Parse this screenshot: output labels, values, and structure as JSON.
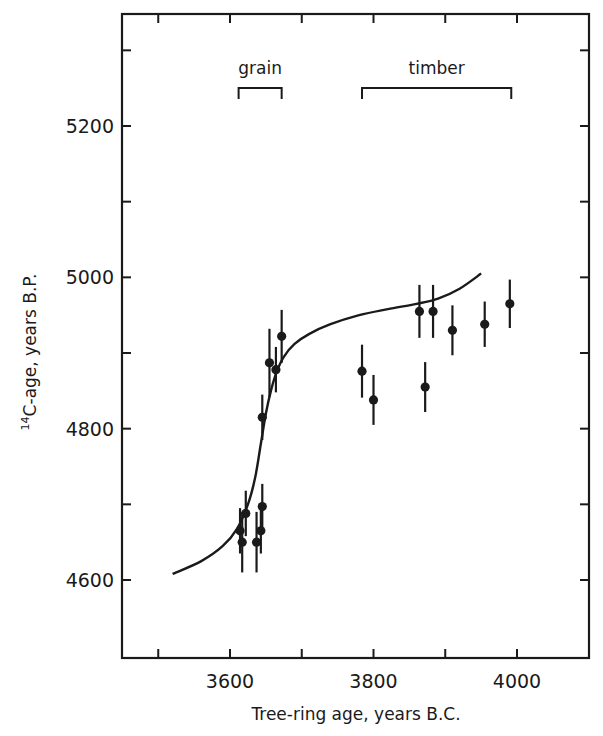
{
  "chart_data": {
    "type": "scatter",
    "title": "",
    "xlabel": "Tree-ring age, years B.C.",
    "ylabel_superscript": "14",
    "ylabel": "C-age, years B.P.",
    "xlim": [
      3450,
      4100
    ],
    "ylim": [
      4500,
      5350
    ],
    "x_ticks": [
      3500,
      3600,
      3700,
      3800,
      3900,
      4000
    ],
    "x_tick_labels": [
      "3600",
      "3800",
      "4000"
    ],
    "x_tick_label_values": [
      3600,
      3800,
      4000
    ],
    "y_ticks": [
      4600,
      4700,
      4800,
      4900,
      5000,
      5100,
      5200,
      5300
    ],
    "y_tick_labels": [
      "4600",
      "4800",
      "5000",
      "5200"
    ],
    "y_tick_label_values": [
      4600,
      4800,
      5000,
      5200
    ],
    "grid": false,
    "annotations": [
      {
        "text": "grain",
        "x_start": 3612,
        "x_end": 3672
      },
      {
        "text": "timber",
        "x_start": 3784,
        "x_end": 3992
      }
    ],
    "series": [
      {
        "name": "grain",
        "type": "scatter-errorbar",
        "points": [
          {
            "x": 3614,
            "y": 4665,
            "err": 30
          },
          {
            "x": 3617,
            "y": 4650,
            "err": 40
          },
          {
            "x": 3622,
            "y": 4688,
            "err": 30
          },
          {
            "x": 3637,
            "y": 4650,
            "err": 40
          },
          {
            "x": 3643,
            "y": 4665,
            "err": 30
          },
          {
            "x": 3645,
            "y": 4697,
            "err": 30
          },
          {
            "x": 3645,
            "y": 4815,
            "err": 30
          },
          {
            "x": 3655,
            "y": 4887,
            "err": 45
          },
          {
            "x": 3664,
            "y": 4878,
            "err": 30
          },
          {
            "x": 3672,
            "y": 4922,
            "err": 35
          }
        ]
      },
      {
        "name": "timber",
        "type": "scatter-errorbar",
        "points": [
          {
            "x": 3784,
            "y": 4876,
            "err": 35
          },
          {
            "x": 3800,
            "y": 4838,
            "err": 33
          },
          {
            "x": 3864,
            "y": 4955,
            "err": 35
          },
          {
            "x": 3872,
            "y": 4855,
            "err": 33
          },
          {
            "x": 3883,
            "y": 4955,
            "err": 35
          },
          {
            "x": 3910,
            "y": 4930,
            "err": 33
          },
          {
            "x": 3955,
            "y": 4938,
            "err": 30
          },
          {
            "x": 3990,
            "y": 4965,
            "err": 32
          }
        ]
      },
      {
        "name": "fitted curve",
        "type": "line",
        "x": [
          3520,
          3560,
          3590,
          3610,
          3625,
          3635,
          3643,
          3650,
          3657,
          3665,
          3675,
          3690,
          3710,
          3740,
          3780,
          3820,
          3860,
          3890,
          3920,
          3950
        ],
        "y": [
          4608,
          4625,
          4645,
          4668,
          4700,
          4735,
          4780,
          4820,
          4850,
          4875,
          4895,
          4912,
          4925,
          4938,
          4950,
          4958,
          4965,
          4972,
          4985,
          5005
        ]
      }
    ]
  }
}
